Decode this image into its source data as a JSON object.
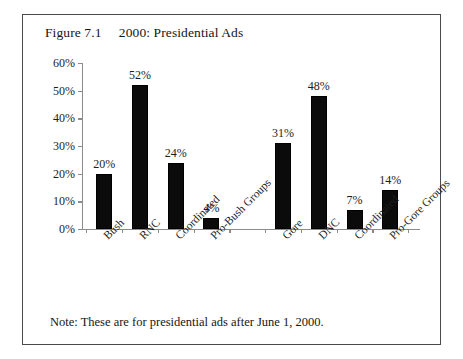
{
  "figure": {
    "title": "Figure 7.1     2000: Presidential Ads",
    "note": "Note: These are for presidential ads after June 1, 2000."
  },
  "chart_data": {
    "type": "bar",
    "title": "Figure 7.1     2000: Presidential Ads",
    "xlabel": "",
    "ylabel": "",
    "ylim": [
      0,
      60
    ],
    "ytick_labels": [
      "0%",
      "10%",
      "20%",
      "30%",
      "40%",
      "50%",
      "60%"
    ],
    "ytick_values": [
      0,
      10,
      20,
      30,
      40,
      50,
      60
    ],
    "grid": false,
    "legend": "none",
    "value_label_suffix": "%",
    "categories": [
      "Bush",
      "RNC",
      "Coordinated",
      "Pro-Bush Groups",
      "",
      "Gore",
      "DNC",
      "Coordinated",
      "Pro-Gore Groups"
    ],
    "values": [
      20,
      52,
      24,
      4,
      null,
      31,
      48,
      7,
      14
    ],
    "value_labels": [
      "20%",
      "52%",
      "24%",
      "4%",
      "",
      "31%",
      "48%",
      "7%",
      "14%"
    ],
    "bar_color": "#0b0b0b",
    "axis_color": "#8c8c8c",
    "groups": [
      {
        "name": "Bush side",
        "categories": [
          "Bush",
          "RNC",
          "Coordinated",
          "Pro-Bush Groups"
        ],
        "values": [
          20,
          52,
          24,
          4
        ]
      },
      {
        "name": "Gore side",
        "categories": [
          "Gore",
          "DNC",
          "Coordinated",
          "Pro-Gore Groups"
        ],
        "values": [
          31,
          48,
          7,
          14
        ]
      }
    ],
    "note": "Note: These are for presidential ads after June 1, 2000."
  }
}
